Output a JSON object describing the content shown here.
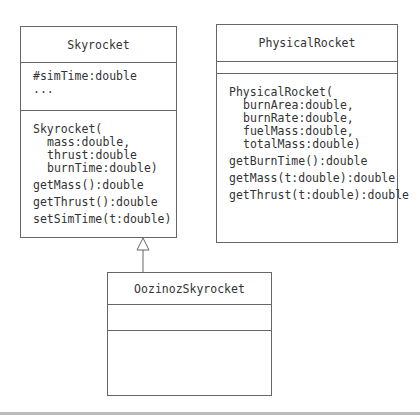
{
  "classes": {
    "skyrocket": {
      "name": "Skyrocket",
      "attributes": [
        "#simTime:double",
        "..."
      ],
      "constructor": {
        "head": "Skyrocket(",
        "params": [
          "mass:double,",
          "thrust:double",
          "burnTime:double)"
        ]
      },
      "methods": [
        "getMass():double",
        "getThrust():double",
        "setSimTime(t:double)"
      ]
    },
    "physical_rocket": {
      "name": "PhysicalRocket",
      "attributes": [],
      "constructor": {
        "head": "PhysicalRocket(",
        "params": [
          "burnArea:double,",
          "burnRate:double,",
          "fuelMass:double,",
          "totalMass:double)"
        ]
      },
      "methods": [
        "getBurnTime():double",
        "getMass(t:double):double",
        "getThrust(t:double):double"
      ]
    },
    "oozinoz_skyrocket": {
      "name": "OozinozSkyrocket",
      "attributes": [],
      "methods": []
    }
  },
  "relationships": [
    {
      "type": "generalization",
      "from": "OozinozSkyrocket",
      "to": "Skyrocket"
    }
  ]
}
